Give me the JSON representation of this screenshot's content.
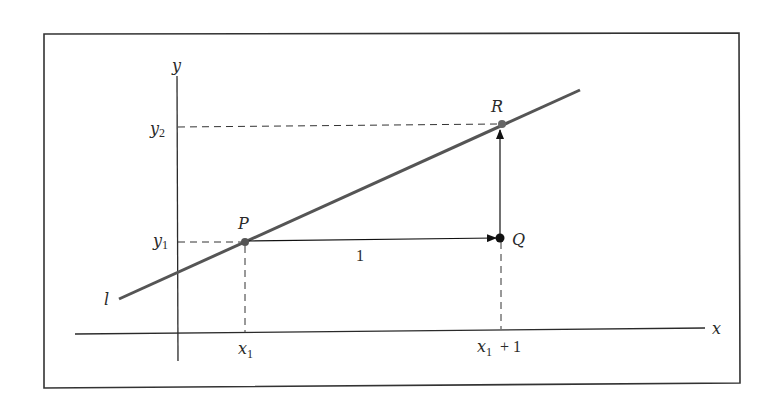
{
  "figure": {
    "axes": {
      "x_label": "x",
      "y_label": "y"
    },
    "points": {
      "P": {
        "label": "P"
      },
      "Q": {
        "label": "Q"
      },
      "R": {
        "label": "R"
      }
    },
    "line_label": "l",
    "tick_labels": {
      "x1": {
        "base": "x",
        "sub": "1"
      },
      "x1_plus_1": {
        "base": "x",
        "sub": "1",
        "suffix": "+ 1"
      },
      "y1": {
        "base": "y",
        "sub": "1"
      },
      "y2": {
        "base": "y",
        "sub": "2"
      }
    },
    "run_label": "1",
    "colors": {
      "line_l": "#555555",
      "axes": "#2a2a2a",
      "points": "#111111",
      "frame": "#333333"
    }
  }
}
